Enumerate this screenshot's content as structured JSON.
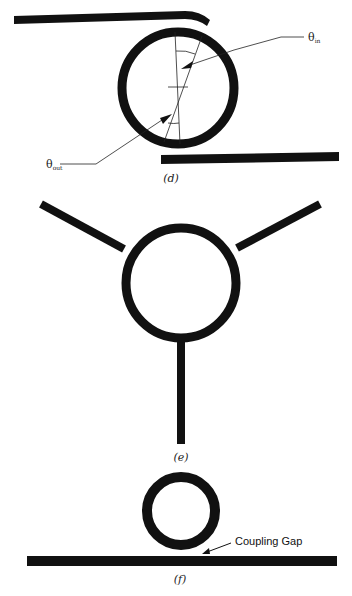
{
  "figure": {
    "panels": [
      {
        "id": "d",
        "caption": "(d)",
        "description": "Ring resonator coupled to two parallel lines with angle annotations",
        "labels": {
          "theta_in": "θ",
          "theta_in_sub": "in",
          "theta_out": "θ",
          "theta_out_sub": "out"
        }
      },
      {
        "id": "e",
        "caption": "(e)",
        "description": "Ring with three feed lines at 120 degree spacing"
      },
      {
        "id": "f",
        "caption": "(f)",
        "description": "Ring above a straight line with coupling gap",
        "labels": {
          "coupling_gap": "Coupling Gap"
        }
      }
    ],
    "colors": {
      "ink": "#111111",
      "background": "#ffffff"
    }
  }
}
